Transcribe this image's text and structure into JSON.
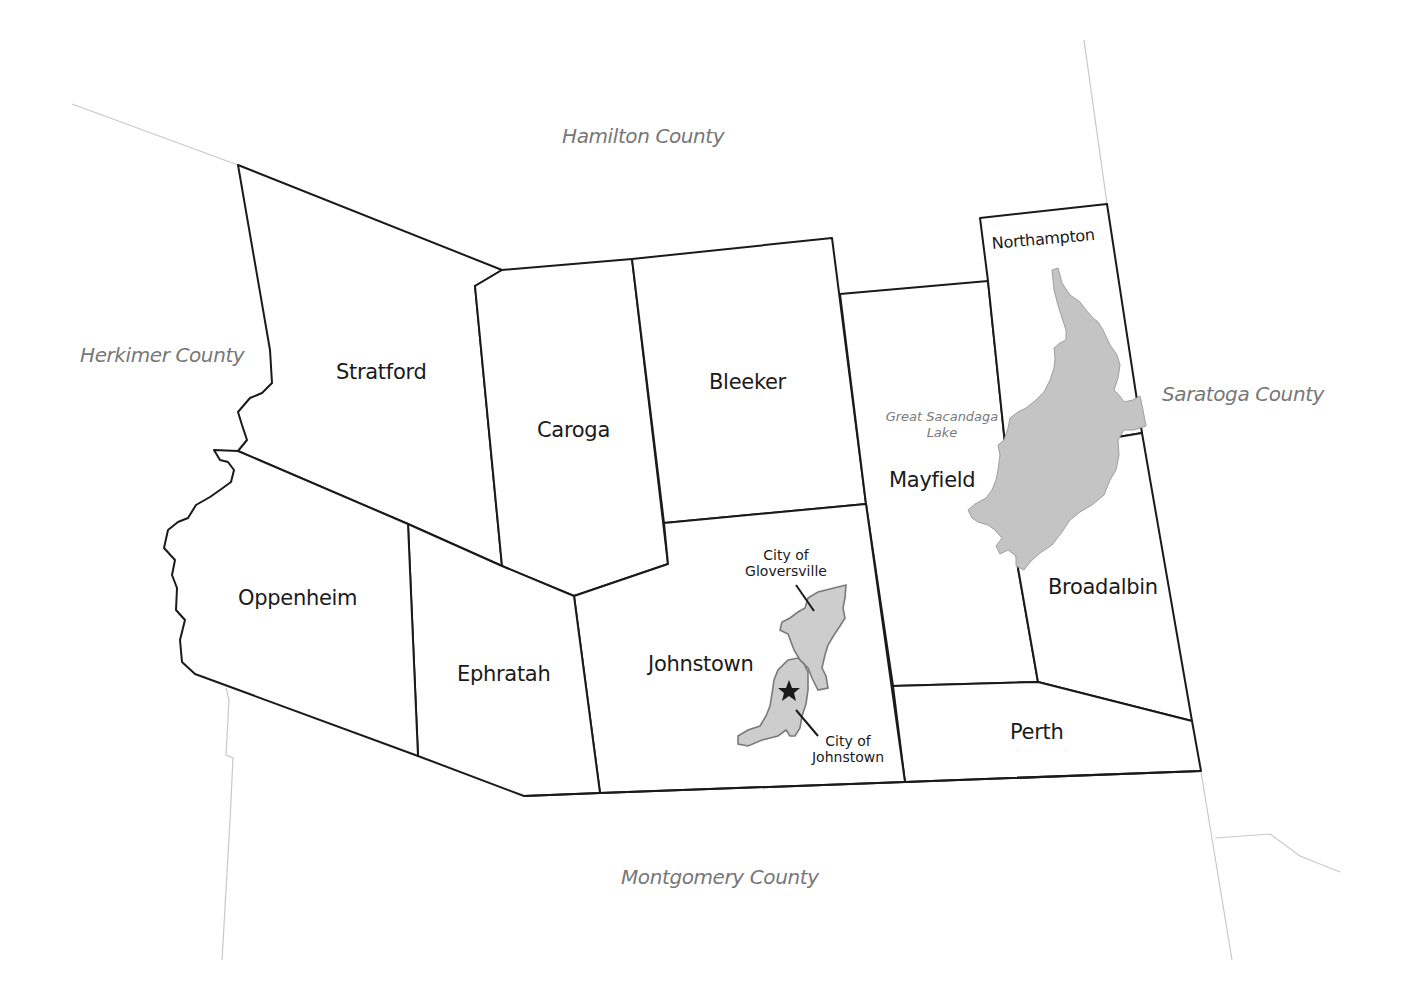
{
  "map": {
    "title": "Fulton County towns",
    "colors": {
      "background": "#ffffff",
      "town_border": "#1a1a1a",
      "county_border": "#9a9a9a",
      "lake_fill": "#c4c4c4",
      "city_fill": "#cdcdcd",
      "county_label": "#777777",
      "town_label": "#1a1a1a"
    },
    "neighboring_counties": {
      "north": "Hamilton County",
      "west": "Herkimer County",
      "east": "Saratoga County",
      "south": "Montgomery County"
    },
    "towns": {
      "stratford": "Stratford",
      "caroga": "Caroga",
      "bleeker": "Bleeker",
      "northampton": "Northampton",
      "mayfield": "Mayfield",
      "broadalbin": "Broadalbin",
      "oppenheim": "Oppenheim",
      "ephratah": "Ephratah",
      "johnstown": "Johnstown",
      "perth": "Perth"
    },
    "water_features": {
      "lake_line1": "Great Sacandaga",
      "lake_line2": "Lake"
    },
    "cities": {
      "gloversville_line1": "City of",
      "gloversville_line2": "Gloversville",
      "johnstown_line1": "City of",
      "johnstown_line2": "Johnstown"
    },
    "markers": {
      "county_seat": "star-icon"
    }
  }
}
